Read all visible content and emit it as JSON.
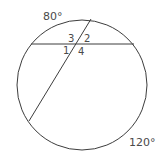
{
  "diagram": {
    "type": "circle-intersecting-chords",
    "circle": {
      "cx": 82,
      "cy": 85,
      "r": 65
    },
    "chords": [
      {
        "name": "horizontal-chord",
        "x1": 31,
        "y1": 44,
        "x2": 134,
        "y2": 44
      },
      {
        "name": "slanted-chord",
        "x1": 91,
        "y1": 19,
        "x2": 29,
        "y2": 121
      }
    ],
    "intersection": {
      "x": 77,
      "y": 44
    },
    "arc_labels": [
      {
        "id": "top-arc",
        "text": "80°",
        "x": 43,
        "y": 20
      },
      {
        "id": "bottom-arc",
        "text": "120°",
        "x": 129,
        "y": 146
      }
    ],
    "angle_labels": [
      {
        "id": "angle-3",
        "text": "3",
        "x": 68,
        "y": 42
      },
      {
        "id": "angle-2",
        "text": "2",
        "x": 84,
        "y": 42
      },
      {
        "id": "angle-1",
        "text": "1",
        "x": 63,
        "y": 54
      },
      {
        "id": "angle-4",
        "text": "4",
        "x": 78,
        "y": 55
      }
    ],
    "colors": {
      "line": "#3d3d3d",
      "text": "#4a4a4a",
      "background": "#ffffff"
    }
  }
}
